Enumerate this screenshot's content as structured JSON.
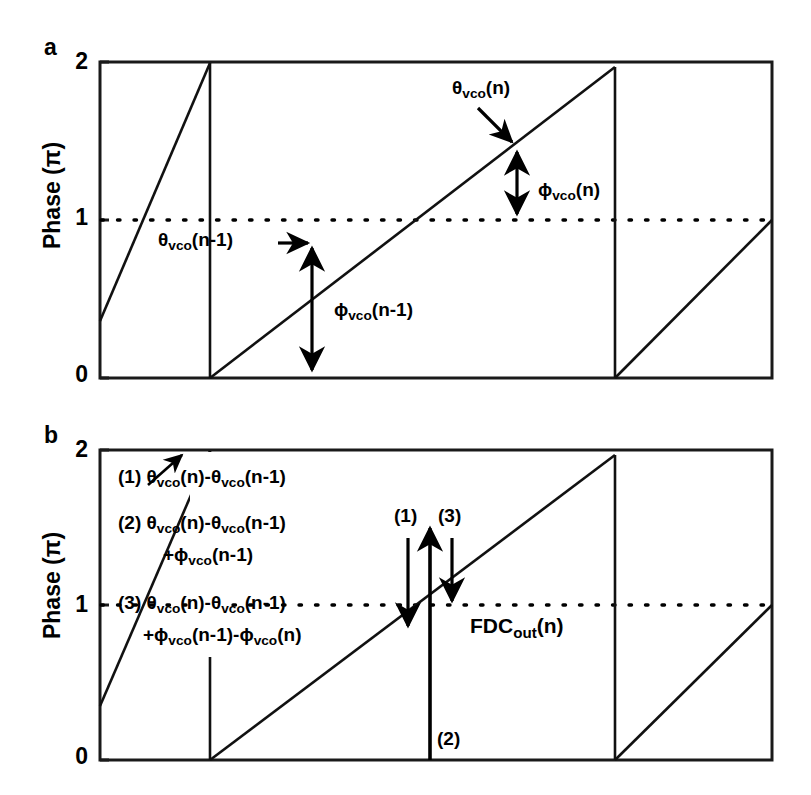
{
  "figure": {
    "panels": [
      {
        "letter": "a",
        "y_axis_title": "Phase (π)",
        "y_ticks": [
          "2",
          "1",
          "0"
        ],
        "annotations": [
          {
            "id": "theta-n",
            "text_html": "θ<sub>vco</sub>(n)"
          },
          {
            "id": "phi-n",
            "text_html": "ϕ<sub>vco</sub>(n)"
          },
          {
            "id": "theta-n-1",
            "text_html": "θ<sub>vco</sub>(n-1)"
          },
          {
            "id": "phi-n-1",
            "text_html": "ϕ<sub>vco</sub>(n-1)"
          }
        ]
      },
      {
        "letter": "b",
        "y_axis_title": "Phase (π)",
        "y_ticks": [
          "2",
          "1",
          "0"
        ],
        "legend": [
          {
            "id": "legend-1",
            "line1_html": "(1) θ<sub>vco</sub>(n)-θ<sub>vco</sub>(n-1)",
            "line2_html": ""
          },
          {
            "id": "legend-2",
            "line1_html": "(2) θ<sub>vco</sub>(n)-θ<sub>vco</sub>(n-1)",
            "line2_html": "+ϕ<sub>vco</sub>(n-1)"
          },
          {
            "id": "legend-3",
            "line1_html": "(3) θ<sub>vco</sub>(n)-θ<sub>vco</sub>(n-1)",
            "line2_html": "+ϕ<sub>vco</sub>(n-1)-ϕ<sub>vco</sub>(n)"
          }
        ],
        "annotations": [
          {
            "id": "marker-1",
            "text_html": "(1)"
          },
          {
            "id": "marker-3",
            "text_html": "(3)"
          },
          {
            "id": "marker-2",
            "text_html": "(2)"
          },
          {
            "id": "fdc-out",
            "text_html": "FDC<sub>out</sub>(n)"
          }
        ]
      }
    ]
  },
  "chart_data": {
    "type": "line",
    "title": "",
    "xlabel": "",
    "ylabel": "Phase (π)",
    "ylim": [
      0,
      2
    ],
    "yticks": [
      0,
      1,
      2
    ],
    "grid": false,
    "reference_line": {
      "y": 1,
      "style": "dotted"
    },
    "panels": [
      {
        "name": "a",
        "series": [
          {
            "name": "vco-phase-sawtooth",
            "style": "solid",
            "description": "Sawtooth phase ramp wrapping at 2π",
            "points": [
              {
                "x": 0.0,
                "y": 1.65
              },
              {
                "x": 0.163,
                "y": 2.0
              },
              {
                "x": 0.163,
                "y": 0.0
              },
              {
                "x": 0.765,
                "y": 1.97
              },
              {
                "x": 0.765,
                "y": 0.0
              },
              {
                "x": 1.0,
                "y": 1.0
              }
            ]
          }
        ],
        "markers": [
          {
            "name": "theta-n-1-point",
            "x": 0.316,
            "y": 0.86
          },
          {
            "name": "theta-n-point",
            "x": 0.62,
            "y": 1.44
          }
        ],
        "arrows": [
          {
            "name": "phi-n-1-arrow",
            "x": 0.316,
            "y_from": 0.86,
            "y_to": 0.0,
            "heads": "both"
          },
          {
            "name": "phi-n-arrow",
            "x": 0.62,
            "y_from": 1.44,
            "y_to": 1.0,
            "heads": "both"
          },
          {
            "name": "theta-n-pointer",
            "style": "single"
          },
          {
            "name": "theta-n-1-pointer",
            "style": "single"
          }
        ]
      },
      {
        "name": "b",
        "series": [
          {
            "name": "vco-phase-sawtooth",
            "style": "solid",
            "description": "Sawtooth phase ramp wrapping at 2π",
            "points": [
              {
                "x": 0.0,
                "y": 1.65
              },
              {
                "x": 0.163,
                "y": 2.0
              },
              {
                "x": 0.163,
                "y": 0.0
              },
              {
                "x": 0.765,
                "y": 1.97
              },
              {
                "x": 0.765,
                "y": 0.0
              },
              {
                "x": 1.0,
                "y": 1.0
              }
            ]
          }
        ],
        "arrows": [
          {
            "name": "arrow-1",
            "x": 0.44,
            "y_from": 1.44,
            "y_to": 0.86,
            "heads": "down"
          },
          {
            "name": "arrow-2",
            "x": 0.478,
            "y_from": 0.0,
            "y_to": 1.58,
            "heads": "up"
          },
          {
            "name": "arrow-3",
            "x": 0.515,
            "y_from": 1.44,
            "y_to": 1.0,
            "heads": "down"
          }
        ]
      }
    ]
  }
}
